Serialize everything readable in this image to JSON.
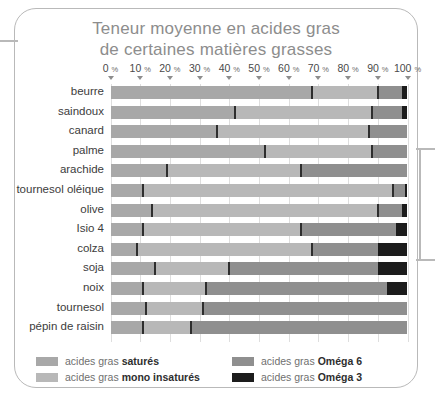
{
  "title": {
    "line1": "Teneur moyenne en acides gras",
    "line2": "de certaines matières grasses"
  },
  "colors": {
    "satures": "#a8a8a8",
    "mono": "#b8b8b8",
    "omega6": "#8f8f8f",
    "omega3": "#1c1c1c",
    "separator": "#2e2e2e",
    "gridline": "#dedede",
    "frame": "#b9b9b9",
    "title_text": "#8d8d8d",
    "label_text": "#3c3c3c"
  },
  "legend": {
    "position": "bottom",
    "items": [
      {
        "label_plain": "acides gras ",
        "label_bold": "saturés",
        "key": "satures",
        "color": "#a8a8a8"
      },
      {
        "label_plain": "acides gras ",
        "label_bold": "mono insaturés",
        "key": "mono",
        "color": "#b8b8b8"
      },
      {
        "label_plain": "acides gras ",
        "label_bold": "Oméga 6",
        "key": "omega6",
        "color": "#8f8f8f"
      },
      {
        "label_plain": "acides gras ",
        "label_bold": "Oméga 3",
        "key": "omega3",
        "color": "#1c1c1c"
      }
    ]
  },
  "chart_data": {
    "type": "bar",
    "orientation": "horizontal",
    "stacked": true,
    "title": "Teneur moyenne en acides gras de certaines matières grasses",
    "xlabel": "",
    "ylabel": "",
    "xlim": [
      0,
      100
    ],
    "unit": "%",
    "grid": true,
    "legend_position": "bottom",
    "tick_labels": [
      "0 %",
      "10 %",
      "20 %",
      "30 %",
      "40 %",
      "50 %",
      "60 %",
      "70 %",
      "80 %",
      "90 %",
      "100 %"
    ],
    "ticks": [
      0,
      10,
      20,
      30,
      40,
      50,
      60,
      70,
      80,
      90,
      100
    ],
    "categories": [
      "beurre",
      "saindoux",
      "canard",
      "palme",
      "arachide",
      "tournesol oléique",
      "olive",
      "Isio 4",
      "colza",
      "soja",
      "noix",
      "tournesol",
      "pépin de raisin"
    ],
    "series": [
      {
        "name": "acides gras saturés",
        "key": "satures",
        "color": "#a8a8a8",
        "values": [
          68,
          42,
          36,
          52,
          19,
          11,
          14,
          11,
          9,
          15,
          11,
          12,
          11
        ]
      },
      {
        "name": "acides gras mono insaturés",
        "key": "mono",
        "color": "#b8b8b8",
        "values": [
          22,
          46,
          51,
          36,
          45,
          84,
          76,
          53,
          59,
          25,
          21,
          19,
          16
        ]
      },
      {
        "name": "acides gras Oméga 6",
        "key": "omega6",
        "color": "#8f8f8f",
        "values": [
          8,
          10,
          13,
          12,
          36,
          4,
          8,
          32,
          22,
          50,
          61,
          69,
          73
        ]
      },
      {
        "name": "acides gras Oméga 3",
        "key": "omega3",
        "color": "#1c1c1c",
        "values": [
          2,
          2,
          0,
          0,
          0,
          1,
          2,
          4,
          10,
          10,
          7,
          0,
          0
        ]
      }
    ]
  }
}
